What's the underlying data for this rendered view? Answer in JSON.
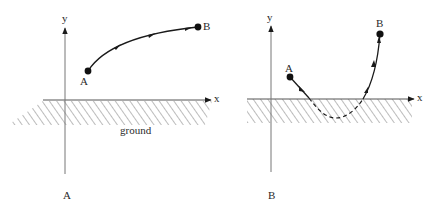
{
  "panels": [
    {
      "id": "A",
      "caption": "A",
      "axes": {
        "x_label": "x",
        "y_label": "y"
      },
      "ground_label": "ground",
      "points": {
        "start": "A",
        "end": "B"
      },
      "trajectory": "solid curve from A up-right to B, entirely above ground"
    },
    {
      "id": "B",
      "caption": "B",
      "axes": {
        "x_label": "x",
        "y_label": "y"
      },
      "points": {
        "start": "A",
        "end": "B"
      },
      "trajectory": "curve from A dips below ground (dashed), then rises steeply to B"
    }
  ],
  "colors": {
    "ink": "#1a1a1a",
    "axis": "#555555",
    "hatch": "#777777",
    "background": "#ffffff"
  }
}
